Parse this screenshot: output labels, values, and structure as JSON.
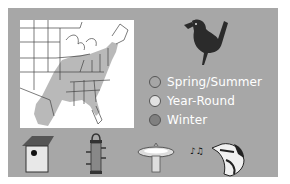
{
  "legend": {
    "items": [
      {
        "label": "Spring/Summer",
        "color": "#a6a6a6"
      },
      {
        "label": "Year-Round",
        "color": "#e2e2e2"
      },
      {
        "label": "Winter",
        "color": "#808080"
      }
    ]
  },
  "map": {
    "region": "Eastern United States",
    "shaded_color": "#b9b9b9"
  },
  "icons": [
    "birdhouse-icon",
    "tube-feeder-icon",
    "birdbath-icon",
    "singing-bird-icon"
  ],
  "colors": {
    "panel": "#a7a7a7",
    "map_background": "#ffffff",
    "bird": "#2b2b2b"
  }
}
